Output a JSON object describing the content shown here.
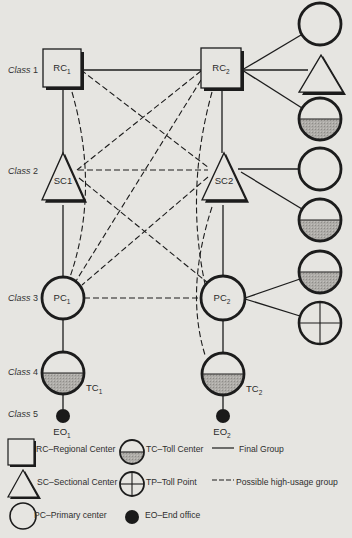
{
  "diagram": {
    "colors": {
      "background": "#e6e5e1",
      "stroke": "#1c1c1c",
      "shading": "#a9a7a3",
      "end_office_fill": "#1a1a1a"
    },
    "class_labels": [
      {
        "text": "Class",
        "num": "1",
        "x": 8,
        "y": 73
      },
      {
        "text": "Class",
        "num": "2",
        "x": 8,
        "y": 174
      },
      {
        "text": "Class",
        "num": "3",
        "x": 8,
        "y": 301
      },
      {
        "text": "Class",
        "num": "4",
        "x": 8,
        "y": 375
      },
      {
        "text": "Class",
        "num": "5",
        "x": 8,
        "y": 417
      }
    ],
    "nodes": [
      {
        "id": "RC1",
        "type": "RC",
        "label": "RC",
        "sub": "1",
        "x": 62,
        "y": 68,
        "size": 38
      },
      {
        "id": "RC2",
        "type": "RC",
        "label": "RC",
        "sub": "2",
        "x": 221,
        "y": 68,
        "size": 40
      },
      {
        "id": "SC1",
        "type": "SC",
        "label": "SC1",
        "sub": "",
        "x": 63,
        "y": 182,
        "w": 42,
        "h": 47
      },
      {
        "id": "SC2",
        "type": "SC",
        "label": "SC2",
        "sub": "",
        "x": 224,
        "y": 182,
        "w": 44,
        "h": 47
      },
      {
        "id": "PC1",
        "type": "PC",
        "label": "PC",
        "sub": "1",
        "x": 63,
        "y": 298,
        "r": 21
      },
      {
        "id": "PC2",
        "type": "PC",
        "label": "PC",
        "sub": "2",
        "x": 223,
        "y": 298,
        "r": 22
      },
      {
        "id": "TC1",
        "type": "TC",
        "label": "TC",
        "sub": "1",
        "x": 63,
        "y": 373,
        "r": 21,
        "label_pos": "right-below"
      },
      {
        "id": "TC2",
        "type": "TC",
        "label": "TC",
        "sub": "2",
        "x": 223,
        "y": 374,
        "r": 21,
        "label_pos": "right-below"
      },
      {
        "id": "EO1",
        "type": "EO",
        "label": "EO",
        "sub": "1",
        "x": 63,
        "y": 416,
        "r": 7,
        "label_pos": "below"
      },
      {
        "id": "EO2",
        "type": "EO",
        "label": "EO",
        "sub": "2",
        "x": 223,
        "y": 416,
        "r": 7,
        "label_pos": "below"
      },
      {
        "id": "R1",
        "type": "PC",
        "label": "",
        "sub": "",
        "x": 320,
        "y": 24,
        "r": 21
      },
      {
        "id": "R2",
        "type": "SC",
        "label": "",
        "sub": "",
        "x": 321,
        "y": 78,
        "w": 44,
        "h": 37
      },
      {
        "id": "R3",
        "type": "TC",
        "label": "",
        "sub": "",
        "x": 320,
        "y": 119,
        "r": 21
      },
      {
        "id": "R4",
        "type": "PC",
        "label": "",
        "sub": "",
        "x": 320,
        "y": 169,
        "r": 21
      },
      {
        "id": "R5",
        "type": "TC",
        "label": "",
        "sub": "",
        "x": 320,
        "y": 220,
        "r": 21
      },
      {
        "id": "R6",
        "type": "TC",
        "label": "",
        "sub": "",
        "x": 320,
        "y": 272,
        "r": 21
      },
      {
        "id": "R7",
        "type": "TP",
        "label": "",
        "sub": "",
        "x": 320,
        "y": 323,
        "r": 21
      }
    ],
    "final_links": [
      {
        "from": "RC1",
        "to": "RC2",
        "pts": [
          81,
          70,
          201,
          70
        ]
      },
      {
        "from": "RC1",
        "to": "SC1",
        "pts": [
          63,
          87,
          63,
          153
        ]
      },
      {
        "from": "RC2",
        "to": "SC2",
        "pts": [
          222,
          88,
          222,
          153
        ]
      },
      {
        "from": "SC1",
        "to": "PC1",
        "pts": [
          63,
          205,
          63,
          277
        ]
      },
      {
        "from": "SC2",
        "to": "PC2",
        "pts": [
          223,
          205,
          223,
          276
        ]
      },
      {
        "from": "PC1",
        "to": "TC1",
        "pts": [
          63,
          319,
          63,
          352
        ]
      },
      {
        "from": "PC2",
        "to": "TC2",
        "pts": [
          223,
          320,
          223,
          353
        ]
      },
      {
        "from": "TC1",
        "to": "EO1",
        "pts": [
          63,
          394,
          63,
          409
        ]
      },
      {
        "from": "TC2",
        "to": "EO2",
        "pts": [
          223,
          395,
          223,
          409
        ]
      },
      {
        "from": "RC2",
        "to": "R1",
        "pts": [
          242,
          70,
          301,
          35
        ]
      },
      {
        "from": "RC2",
        "to": "R2",
        "pts": [
          242,
          70,
          308,
          70
        ]
      },
      {
        "from": "RC2",
        "to": "R3",
        "pts": [
          242,
          70,
          302,
          108
        ]
      },
      {
        "from": "SC2",
        "to": "R4",
        "pts": [
          238,
          169,
          299,
          169
        ]
      },
      {
        "from": "SC2",
        "to": "R5",
        "pts": [
          241,
          172,
          302,
          209
        ]
      },
      {
        "from": "PC2",
        "to": "R6",
        "pts": [
          245,
          298,
          300,
          279
        ]
      },
      {
        "from": "PC2",
        "to": "R7",
        "pts": [
          245,
          299,
          300,
          316
        ]
      }
    ],
    "high_usage_links": [
      {
        "from": "RC1",
        "to": "SC2",
        "pts": [
          81,
          70,
          209,
          168
        ]
      },
      {
        "from": "RC2",
        "to": "SC1",
        "pts": [
          201,
          71,
          77,
          170
        ]
      },
      {
        "from": "SC1",
        "to": "SC2",
        "pts": [
          78,
          170,
          208,
          170
        ]
      },
      {
        "from": "SC1",
        "to": "PC2",
        "pts": [
          79,
          178,
          208,
          283
        ]
      },
      {
        "from": "SC2",
        "to": "PC1",
        "pts": [
          208,
          177,
          82,
          285
        ]
      },
      {
        "from": "RC2",
        "to": "PC1",
        "pts": [
          201,
          80,
          76,
          281
        ]
      },
      {
        "from": "PC1",
        "to": "PC2",
        "pts": [
          84,
          298,
          201,
          298
        ]
      },
      {
        "from": "RC1",
        "to": "PC1",
        "curve": "M 72 92 Q 100 190 70 277"
      },
      {
        "from": "RC2",
        "to": "PC2",
        "curve": "M 212 92 Q 185 190 205 284"
      },
      {
        "from": "SC2",
        "to": "TC2",
        "curve": "M 212 207 Q 185 290 205 355"
      }
    ],
    "legend": {
      "items": [
        {
          "symbol": "RC",
          "text": "RC–Regional Center",
          "x": 8,
          "y": 450
        },
        {
          "symbol": "TC",
          "text": "TC–Toll Center",
          "x": 118,
          "y": 450
        },
        {
          "symbol": "solid-line",
          "text": "Final Group",
          "x": 212,
          "y": 450
        },
        {
          "symbol": "SC",
          "text": "SC–Sectional Center",
          "x": 8,
          "y": 483
        },
        {
          "symbol": "TP",
          "text": "TP–Toll Point",
          "x": 118,
          "y": 483
        },
        {
          "symbol": "dashed-line",
          "text": "Possible high-usage group",
          "x": 212,
          "y": 483
        },
        {
          "symbol": "PC",
          "text": "PC–Primary center",
          "x": 8,
          "y": 516
        },
        {
          "symbol": "EO",
          "text": "EO–End office",
          "x": 118,
          "y": 516
        }
      ]
    }
  }
}
